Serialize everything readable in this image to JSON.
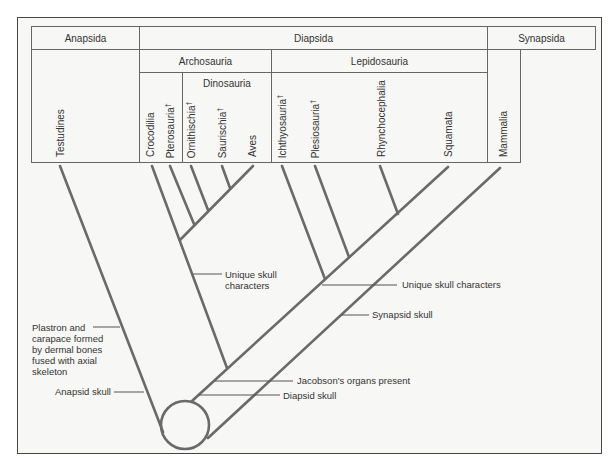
{
  "groups": {
    "top": [
      "Anapsida",
      "Diapsida",
      "Synapsida"
    ],
    "archosauria": "Archosauria",
    "lepidosauria": "Lepidosauria",
    "dinosauria": "Dinosauria"
  },
  "taxa": [
    {
      "name": "Testudines",
      "extinct": false
    },
    {
      "name": "Crocodilia",
      "extinct": false
    },
    {
      "name": "Pterosauria",
      "extinct": true
    },
    {
      "name": "Ornithischia",
      "extinct": true
    },
    {
      "name": "Saurischia",
      "extinct": true
    },
    {
      "name": "Aves",
      "extinct": false
    },
    {
      "name": "Ichthyosauria",
      "extinct": true
    },
    {
      "name": "Plesiosauria",
      "extinct": true
    },
    {
      "name": "Rhynchocephalia",
      "extinct": false
    },
    {
      "name": "Squamata",
      "extinct": false
    },
    {
      "name": "Mammalia",
      "extinct": false
    }
  ],
  "extinct_mark": "†",
  "annotations": {
    "plastron": [
      "Plastron and",
      "carapace formed",
      "by dermal bones",
      "fused with axial",
      "skeleton"
    ],
    "anapsid": "Anapsid skull",
    "archosaur_unique": [
      "Unique skull",
      "characters"
    ],
    "lepidosaur_unique": "Unique skull characters",
    "synapsid": "Synapsid skull",
    "jacobson": "Jacobson's organs present",
    "diapsid": "Diapsid skull"
  },
  "colors": {
    "line": "#666666",
    "border": "#666666",
    "background": "#f7f7f5"
  }
}
